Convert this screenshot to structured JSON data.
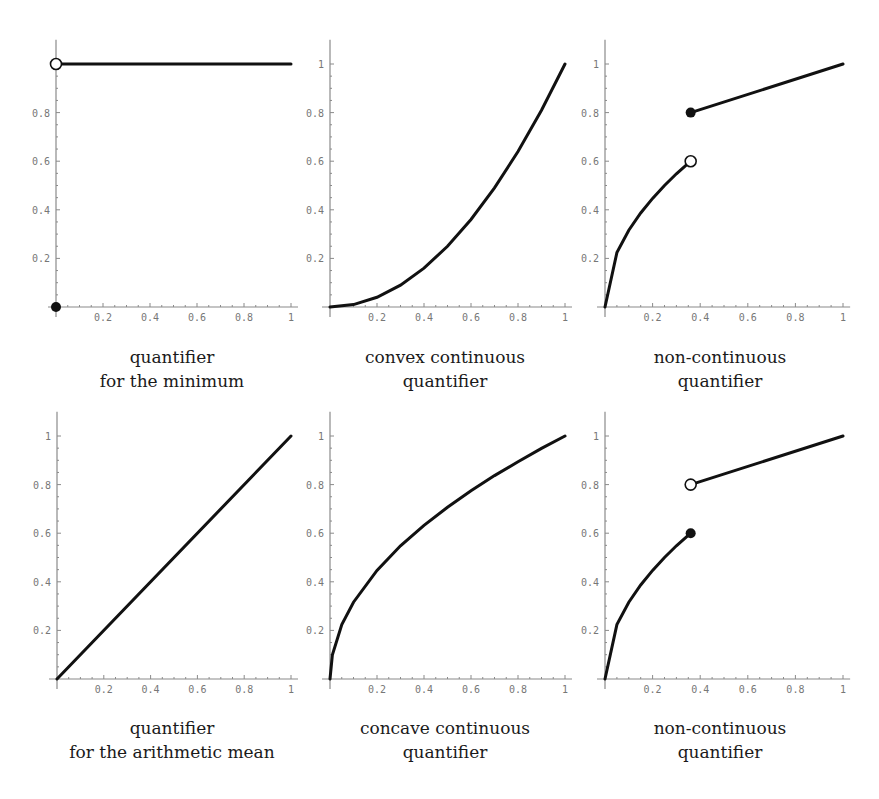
{
  "chart_data": [
    {
      "type": "line",
      "panel": "top-left",
      "title": "",
      "caption": [
        "quantifier",
        "for the minimum"
      ],
      "xlabel": "",
      "ylabel": "",
      "xlim": [
        0,
        1
      ],
      "ylim": [
        0,
        1.1
      ],
      "x_ticks": [
        "0.2",
        "0.4",
        "0.6",
        "0.8",
        "1"
      ],
      "y_ticks": [
        "0.2",
        "0.4",
        "0.6",
        "0.8"
      ],
      "series": [
        {
          "name": "Q(x)",
          "x": [
            0,
            1
          ],
          "y": [
            1,
            1
          ]
        }
      ],
      "markers": [
        {
          "x": 0,
          "y": 1,
          "style": "open"
        },
        {
          "x": 0,
          "y": 0,
          "style": "filled"
        }
      ],
      "grid": false,
      "legend": null
    },
    {
      "type": "line",
      "panel": "top-middle",
      "caption": [
        "convex continuous",
        "quantifier"
      ],
      "xlim": [
        0,
        1
      ],
      "ylim": [
        0,
        1.1
      ],
      "x_ticks": [
        "0.2",
        "0.4",
        "0.6",
        "0.8",
        "1"
      ],
      "y_ticks": [
        "0.2",
        "0.4",
        "0.6",
        "0.8",
        "1"
      ],
      "series": [
        {
          "name": "Q(x)=x^2",
          "x": [
            0,
            0.1,
            0.2,
            0.3,
            0.4,
            0.5,
            0.6,
            0.7,
            0.8,
            0.9,
            1
          ],
          "y": [
            0,
            0.01,
            0.04,
            0.09,
            0.16,
            0.25,
            0.36,
            0.49,
            0.64,
            0.81,
            1
          ]
        }
      ],
      "markers": [],
      "grid": false,
      "legend": null
    },
    {
      "type": "line",
      "panel": "top-right",
      "caption": [
        "non-continuous",
        "quantifier"
      ],
      "xlim": [
        0,
        1
      ],
      "ylim": [
        0,
        1.1
      ],
      "x_ticks": [
        "0.2",
        "0.4",
        "0.6",
        "0.8",
        "1"
      ],
      "y_ticks": [
        "0.2",
        "0.4",
        "0.6",
        "0.8",
        "1"
      ],
      "series": [
        {
          "name": "lower branch",
          "x": [
            0,
            0.05,
            0.1,
            0.15,
            0.2,
            0.25,
            0.3,
            0.36
          ],
          "y": [
            0,
            0.224,
            0.316,
            0.387,
            0.447,
            0.5,
            0.548,
            0.6
          ]
        },
        {
          "name": "upper branch",
          "x": [
            0.36,
            1
          ],
          "y": [
            0.8,
            1
          ]
        }
      ],
      "markers": [
        {
          "x": 0.36,
          "y": 0.6,
          "style": "open"
        },
        {
          "x": 0.36,
          "y": 0.8,
          "style": "filled"
        }
      ],
      "grid": false,
      "legend": null
    },
    {
      "type": "line",
      "panel": "bottom-left",
      "caption": [
        "quantifier",
        "for the arithmetic mean"
      ],
      "xlim": [
        0,
        1
      ],
      "ylim": [
        0,
        1.1
      ],
      "x_ticks": [
        "0.2",
        "0.4",
        "0.6",
        "0.8",
        "1"
      ],
      "y_ticks": [
        "0.2",
        "0.4",
        "0.6",
        "0.8",
        "1"
      ],
      "series": [
        {
          "name": "Q(x)=x",
          "x": [
            0,
            1
          ],
          "y": [
            0,
            1
          ]
        }
      ],
      "markers": [],
      "grid": false,
      "legend": null
    },
    {
      "type": "line",
      "panel": "bottom-middle",
      "caption": [
        "concave continuous",
        "quantifier"
      ],
      "xlim": [
        0,
        1
      ],
      "ylim": [
        0,
        1.1
      ],
      "x_ticks": [
        "0.2",
        "0.4",
        "0.6",
        "0.8",
        "1"
      ],
      "y_ticks": [
        "0.2",
        "0.4",
        "0.6",
        "0.8",
        "1"
      ],
      "series": [
        {
          "name": "Q(x)=sqrt(x)",
          "x": [
            0,
            0.01,
            0.05,
            0.1,
            0.2,
            0.3,
            0.4,
            0.5,
            0.6,
            0.7,
            0.8,
            0.9,
            1
          ],
          "y": [
            0,
            0.1,
            0.224,
            0.316,
            0.447,
            0.548,
            0.632,
            0.707,
            0.775,
            0.837,
            0.894,
            0.949,
            1
          ]
        }
      ],
      "markers": [],
      "grid": false,
      "legend": null
    },
    {
      "type": "line",
      "panel": "bottom-right",
      "caption": [
        "non-continuous",
        "quantifier"
      ],
      "xlim": [
        0,
        1
      ],
      "ylim": [
        0,
        1.1
      ],
      "x_ticks": [
        "0.2",
        "0.4",
        "0.6",
        "0.8",
        "1"
      ],
      "y_ticks": [
        "0.2",
        "0.4",
        "0.6",
        "0.8",
        "1"
      ],
      "series": [
        {
          "name": "lower branch",
          "x": [
            0,
            0.05,
            0.1,
            0.15,
            0.2,
            0.25,
            0.3,
            0.36
          ],
          "y": [
            0,
            0.224,
            0.316,
            0.387,
            0.447,
            0.5,
            0.548,
            0.6
          ]
        },
        {
          "name": "upper branch",
          "x": [
            0.36,
            1
          ],
          "y": [
            0.8,
            1
          ]
        }
      ],
      "markers": [
        {
          "x": 0.36,
          "y": 0.6,
          "style": "filled"
        },
        {
          "x": 0.36,
          "y": 0.8,
          "style": "open"
        }
      ],
      "grid": false,
      "legend": null
    }
  ],
  "captions": {
    "p1": {
      "line1": "quantifier",
      "line2": "for the minimum"
    },
    "p2": {
      "line1": "convex continuous",
      "line2": "quantifier"
    },
    "p3": {
      "line1": "non-continuous",
      "line2": "quantifier"
    },
    "p4": {
      "line1": "quantifier",
      "line2": "for the arithmetic mean"
    },
    "p5": {
      "line1": "concave continuous",
      "line2": "quantifier"
    },
    "p6": {
      "line1": "non-continuous",
      "line2": "quantifier"
    }
  },
  "colors": {
    "curve": "#111111",
    "axis": "#8a8a8a",
    "tick_label": "#777777"
  }
}
